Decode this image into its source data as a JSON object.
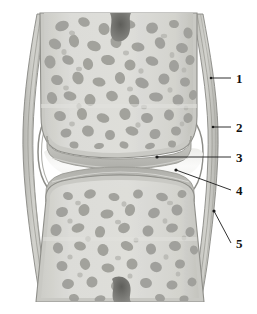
{
  "figure": {
    "background_color": "#ffffff",
    "width": 257,
    "height": 314
  },
  "palette": {
    "bone_marrow_bg": "#d9d9d5",
    "trabecula_dark": "#9a9a96",
    "trabecula_mid": "#ababa6",
    "cortex_light": "#cfcfca",
    "cortex_line": "#8e8e89",
    "cartilage": "#c2c2bd",
    "cartilage_edge": "#9d9d98",
    "capsule_line": "#8b8b86",
    "capsule_fill": "#c9c9c4",
    "cavity": "#f4f4f2",
    "notch_dark": "#6f6f6b",
    "label_color": "#111111",
    "leader_color": "#1a1a1a"
  },
  "labels": [
    {
      "id": "1",
      "text": "1",
      "text_x": 236,
      "text_y": 83,
      "leader": {
        "x1": 231,
        "y1": 78,
        "x2": 211,
        "y2": 78
      },
      "dot": {
        "cx": 211,
        "cy": 78,
        "r": 1.3
      },
      "meaning": "periosteum / bone shaft outer layer"
    },
    {
      "id": "2",
      "text": "2",
      "text_x": 236,
      "text_y": 132,
      "leader": {
        "x1": 231,
        "y1": 127,
        "x2": 213,
        "y2": 127
      },
      "dot": {
        "cx": 213,
        "cy": 127,
        "r": 1.3
      },
      "meaning": "joint capsule fibrous layer"
    },
    {
      "id": "3",
      "text": "3",
      "text_x": 236,
      "text_y": 162,
      "leader": {
        "x1": 231,
        "y1": 157,
        "x2": 157,
        "y2": 157
      },
      "dot": {
        "cx": 157,
        "cy": 157,
        "r": 1.6
      },
      "meaning": "articular cartilage of upper bone"
    },
    {
      "id": "4",
      "text": "4",
      "text_x": 236,
      "text_y": 195,
      "leader": {
        "x1": 231,
        "y1": 190,
        "x2": 176,
        "y2": 170
      },
      "dot": {
        "cx": 176,
        "cy": 170,
        "r": 1.6
      },
      "meaning": "joint cavity with synovial fluid"
    },
    {
      "id": "5",
      "text": "5",
      "text_x": 236,
      "text_y": 248,
      "leader": {
        "x1": 231,
        "y1": 243,
        "x2": 214,
        "y2": 211
      },
      "dot": {
        "cx": 214,
        "cy": 211,
        "r": 1.6
      },
      "meaning": "synovial membrane"
    }
  ],
  "structures": {
    "upper_bone": {
      "name": "upper-bone-epiphysis"
    },
    "lower_bone": {
      "name": "lower-bone-epiphysis"
    },
    "upper_cartilage": {
      "name": "upper-articular-cartilage"
    },
    "lower_cartilage": {
      "name": "lower-articular-cartilage"
    },
    "joint_cavity": {
      "name": "joint-cavity"
    },
    "capsule_left": {
      "name": "joint-capsule-left"
    },
    "capsule_right": {
      "name": "joint-capsule-right"
    },
    "notch_top": {
      "name": "nutrient-canal-top"
    },
    "notch_bottom": {
      "name": "nutrient-canal-bottom"
    }
  }
}
